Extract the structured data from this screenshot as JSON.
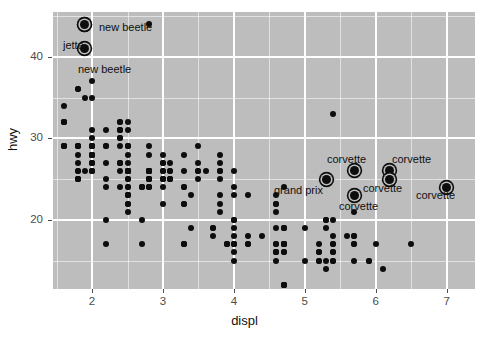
{
  "chart_data": {
    "type": "scatter",
    "title": "",
    "xlabel": "displ",
    "ylabel": "hwy",
    "xlim": [
      1.45,
      7.4
    ],
    "ylim": [
      11.5,
      45.5
    ],
    "xticks": [
      2,
      3,
      4,
      5,
      6,
      7
    ],
    "xtick_labels": [
      "2",
      "3",
      "4",
      "5",
      "6",
      "7"
    ],
    "yticks": [
      20,
      30,
      40
    ],
    "ytick_labels": [
      "20",
      "30",
      "40"
    ],
    "x_minor_ticks": [
      1.5,
      2.5,
      3.5,
      4.5,
      5.5,
      6.5
    ],
    "y_minor_ticks": [
      15,
      25,
      35,
      45
    ],
    "grid": true,
    "legend": "none",
    "panel_fill": "#bdbdbd",
    "grid_color": "#ffffff",
    "point_color": "#0d0d0d",
    "points": [
      [
        1.8,
        29
      ],
      [
        1.8,
        29
      ],
      [
        2.0,
        31
      ],
      [
        2.0,
        30
      ],
      [
        2.8,
        26
      ],
      [
        2.8,
        26
      ],
      [
        3.1,
        27
      ],
      [
        1.8,
        26
      ],
      [
        1.8,
        25
      ],
      [
        2.0,
        28
      ],
      [
        2.0,
        27
      ],
      [
        2.8,
        25
      ],
      [
        2.8,
        25
      ],
      [
        3.1,
        25
      ],
      [
        3.1,
        25
      ],
      [
        2.8,
        24
      ],
      [
        3.1,
        25
      ],
      [
        4.2,
        23
      ],
      [
        5.3,
        20
      ],
      [
        5.3,
        15
      ],
      [
        5.3,
        20
      ],
      [
        5.7,
        17
      ],
      [
        6.0,
        17
      ],
      [
        5.7,
        26
      ],
      [
        5.7,
        23
      ],
      [
        6.2,
        26
      ],
      [
        6.2,
        25
      ],
      [
        7.0,
        24
      ],
      [
        5.3,
        19
      ],
      [
        5.3,
        14
      ],
      [
        5.7,
        15
      ],
      [
        6.5,
        17
      ],
      [
        2.4,
        27
      ],
      [
        2.4,
        30
      ],
      [
        3.1,
        26
      ],
      [
        3.5,
        29
      ],
      [
        3.6,
        26
      ],
      [
        2.4,
        24
      ],
      [
        3.0,
        24
      ],
      [
        3.3,
        22
      ],
      [
        3.3,
        22
      ],
      [
        3.3,
        24
      ],
      [
        3.3,
        24
      ],
      [
        3.3,
        17
      ],
      [
        3.8,
        22
      ],
      [
        3.8,
        21
      ],
      [
        3.8,
        23
      ],
      [
        4.0,
        23
      ],
      [
        3.7,
        19
      ],
      [
        3.7,
        18
      ],
      [
        3.9,
        17
      ],
      [
        3.9,
        17
      ],
      [
        4.7,
        19
      ],
      [
        4.7,
        19
      ],
      [
        4.7,
        12
      ],
      [
        5.2,
        17
      ],
      [
        5.2,
        15
      ],
      [
        3.9,
        17
      ],
      [
        4.7,
        17
      ],
      [
        4.7,
        12
      ],
      [
        4.7,
        17
      ],
      [
        5.2,
        16
      ],
      [
        5.7,
        18
      ],
      [
        5.9,
        15
      ],
      [
        4.7,
        16
      ],
      [
        4.7,
        12
      ],
      [
        4.7,
        17
      ],
      [
        4.7,
        17
      ],
      [
        4.7,
        16
      ],
      [
        4.7,
        12
      ],
      [
        5.2,
        15
      ],
      [
        5.2,
        16
      ],
      [
        5.7,
        17
      ],
      [
        5.9,
        15
      ],
      [
        4.6,
        17
      ],
      [
        5.4,
        16
      ],
      [
        5.4,
        15
      ],
      [
        4.0,
        17
      ],
      [
        4.0,
        17
      ],
      [
        4.0,
        16
      ],
      [
        4.6,
        16
      ],
      [
        5.0,
        15
      ],
      [
        4.2,
        17
      ],
      [
        4.2,
        17
      ],
      [
        4.6,
        16
      ],
      [
        4.6,
        16
      ],
      [
        4.6,
        17
      ],
      [
        5.4,
        15
      ],
      [
        5.4,
        17
      ],
      [
        3.8,
        26
      ],
      [
        3.8,
        25
      ],
      [
        4.0,
        26
      ],
      [
        4.0,
        24
      ],
      [
        4.6,
        21
      ],
      [
        4.6,
        22
      ],
      [
        4.6,
        23
      ],
      [
        4.6,
        22
      ],
      [
        5.4,
        20
      ],
      [
        5.4,
        33
      ],
      [
        1.6,
        32
      ],
      [
        1.6,
        32
      ],
      [
        1.6,
        29
      ],
      [
        1.6,
        32
      ],
      [
        1.6,
        34
      ],
      [
        1.8,
        36
      ],
      [
        1.8,
        36
      ],
      [
        2.0,
        29
      ],
      [
        2.4,
        26
      ],
      [
        2.4,
        27
      ],
      [
        2.4,
        30
      ],
      [
        2.4,
        31
      ],
      [
        2.5,
        26
      ],
      [
        2.5,
        26
      ],
      [
        3.3,
        28
      ],
      [
        2.0,
        26
      ],
      [
        2.0,
        29
      ],
      [
        2.0,
        28
      ],
      [
        2.0,
        27
      ],
      [
        2.7,
        24
      ],
      [
        2.7,
        24
      ],
      [
        2.7,
        24
      ],
      [
        3.0,
        22
      ],
      [
        3.7,
        19
      ],
      [
        4.0,
        20
      ],
      [
        4.7,
        17
      ],
      [
        4.7,
        12
      ],
      [
        4.7,
        19
      ],
      [
        5.7,
        18
      ],
      [
        6.1,
        14
      ],
      [
        4.0,
        15
      ],
      [
        4.2,
        18
      ],
      [
        4.4,
        18
      ],
      [
        4.6,
        15
      ],
      [
        5.4,
        17
      ],
      [
        5.4,
        16
      ],
      [
        5.4,
        18
      ],
      [
        4.0,
        17
      ],
      [
        4.0,
        19
      ],
      [
        4.6,
        19
      ],
      [
        5.0,
        19
      ],
      [
        2.4,
        29
      ],
      [
        2.4,
        27
      ],
      [
        2.5,
        31
      ],
      [
        2.5,
        32
      ],
      [
        3.5,
        27
      ],
      [
        3.5,
        26
      ],
      [
        3.0,
        26
      ],
      [
        3.0,
        25
      ],
      [
        3.5,
        25
      ],
      [
        3.3,
        17
      ],
      [
        3.3,
        17
      ],
      [
        4.0,
        20
      ],
      [
        5.6,
        18
      ],
      [
        3.1,
        26
      ],
      [
        3.8,
        26
      ],
      [
        3.8,
        27
      ],
      [
        3.8,
        28
      ],
      [
        5.3,
        25
      ],
      [
        2.5,
        25
      ],
      [
        2.5,
        24
      ],
      [
        2.5,
        27
      ],
      [
        2.5,
        25
      ],
      [
        2.5,
        26
      ],
      [
        2.5,
        23
      ],
      [
        2.2,
        20
      ],
      [
        2.2,
        17
      ],
      [
        2.5,
        26
      ],
      [
        2.5,
        23
      ],
      [
        2.5,
        26
      ],
      [
        2.5,
        26
      ],
      [
        2.5,
        26
      ],
      [
        2.5,
        26
      ],
      [
        2.2,
        25
      ],
      [
        2.2,
        24
      ],
      [
        2.5,
        24
      ],
      [
        2.5,
        21
      ],
      [
        2.5,
        23
      ],
      [
        2.5,
        22
      ],
      [
        2.5,
        23
      ],
      [
        2.5,
        22
      ],
      [
        2.7,
        20
      ],
      [
        2.7,
        17
      ],
      [
        3.4,
        23
      ],
      [
        3.4,
        19
      ],
      [
        4.0,
        18
      ],
      [
        4.7,
        17
      ],
      [
        2.2,
        29
      ],
      [
        2.2,
        27
      ],
      [
        2.4,
        31
      ],
      [
        2.4,
        32
      ],
      [
        3.0,
        27
      ],
      [
        3.0,
        26
      ],
      [
        3.5,
        26
      ],
      [
        2.2,
        29
      ],
      [
        2.2,
        31
      ],
      [
        2.4,
        31
      ],
      [
        2.4,
        32
      ],
      [
        3.0,
        28
      ],
      [
        3.0,
        27
      ],
      [
        3.3,
        26
      ],
      [
        1.8,
        26
      ],
      [
        1.8,
        25
      ],
      [
        1.8,
        28
      ],
      [
        1.8,
        27
      ],
      [
        1.8,
        25
      ],
      [
        1.8,
        25
      ],
      [
        4.7,
        24
      ],
      [
        5.7,
        21
      ],
      [
        2.8,
        44
      ],
      [
        1.9,
        44
      ],
      [
        1.9,
        41
      ],
      [
        2.0,
        29
      ],
      [
        2.0,
        26
      ],
      [
        2.0,
        28
      ],
      [
        2.0,
        29
      ],
      [
        2.5,
        29
      ],
      [
        2.5,
        29
      ],
      [
        2.8,
        28
      ],
      [
        2.8,
        29
      ],
      [
        1.9,
        35
      ],
      [
        2.0,
        37
      ],
      [
        2.0,
        35
      ],
      [
        2.5,
        29
      ],
      [
        2.5,
        28
      ],
      [
        2.8,
        26
      ],
      [
        2.8,
        26
      ],
      [
        1.6,
        29
      ],
      [
        1.6,
        29
      ],
      [
        1.8,
        29
      ],
      [
        1.8,
        29
      ],
      [
        2.0,
        29
      ],
      [
        2.0,
        26
      ],
      [
        2.5,
        26
      ],
      [
        2.8,
        26
      ],
      [
        2.8,
        26
      ],
      [
        1.9,
        26
      ],
      [
        2.0,
        28
      ],
      [
        2.5,
        26
      ],
      [
        2.8,
        26
      ],
      [
        2.8,
        25
      ],
      [
        2.0,
        27
      ],
      [
        2.0,
        28
      ],
      [
        2.8,
        26
      ],
      [
        2.8,
        26
      ],
      [
        1.6,
        29
      ],
      [
        1.6,
        32
      ],
      [
        2.8,
        25
      ],
      [
        2.8,
        25
      ],
      [
        2.0,
        28
      ],
      [
        2.0,
        28
      ],
      [
        3.0,
        25
      ],
      [
        3.0,
        25
      ],
      [
        2.8,
        24
      ],
      [
        2.8,
        24
      ]
    ],
    "highlighted_points": [
      {
        "label": "new beetle",
        "x": 1.9,
        "y": 44,
        "label_pos": "right"
      },
      {
        "label": "jetta",
        "x": 1.9,
        "y": 44,
        "label_pos": "upleft"
      },
      {
        "label": "new beetle",
        "x": 1.9,
        "y": 41,
        "label_pos": "below"
      },
      {
        "label": "corvette",
        "x": 5.7,
        "y": 26,
        "label_pos": "above"
      },
      {
        "label": "corvette",
        "x": 6.2,
        "y": 26,
        "label_pos": "above"
      },
      {
        "label": "corvette",
        "x": 6.2,
        "y": 25,
        "label_pos": "right"
      },
      {
        "label": "corvette",
        "x": 5.7,
        "y": 23,
        "label_pos": "below"
      },
      {
        "label": "corvette",
        "x": 7.0,
        "y": 24,
        "label_pos": "below"
      },
      {
        "label": "grand prix",
        "x": 5.3,
        "y": 25,
        "label_pos": "left"
      }
    ],
    "annotations": [
      {
        "text": "new beetle",
        "x_px": 99,
        "y_px": 22
      },
      {
        "text": "jetta",
        "x_px": 63,
        "y_px": 40
      },
      {
        "text": "new beetle",
        "x_px": 78,
        "y_px": 64
      },
      {
        "text": "corvette",
        "x_px": 327,
        "y_px": 154
      },
      {
        "text": "corvette",
        "x_px": 392,
        "y_px": 154
      },
      {
        "text": "corvette",
        "x_px": 363,
        "y_px": 183
      },
      {
        "text": "corvette",
        "x_px": 339,
        "y_px": 201
      },
      {
        "text": "corvette",
        "x_px": 416,
        "y_px": 190
      },
      {
        "text": "grand prix",
        "x_px": 274,
        "y_px": 185
      }
    ]
  },
  "axes": {
    "x_title": "displ",
    "y_title": "hwy"
  }
}
